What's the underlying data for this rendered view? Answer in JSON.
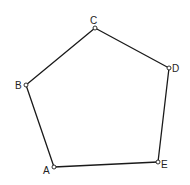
{
  "diagram": {
    "type": "pentagon",
    "vertices": [
      {
        "id": "A",
        "label": "A",
        "x": 54,
        "y": 167,
        "lx": 43,
        "ly": 174
      },
      {
        "id": "B",
        "label": "B",
        "x": 26,
        "y": 85,
        "lx": 15,
        "ly": 89
      },
      {
        "id": "C",
        "label": "C",
        "x": 95,
        "y": 28,
        "lx": 90,
        "ly": 24
      },
      {
        "id": "D",
        "label": "D",
        "x": 169,
        "y": 68,
        "lx": 172,
        "ly": 72
      },
      {
        "id": "E",
        "label": "E",
        "x": 158,
        "y": 162,
        "lx": 161,
        "ly": 168
      }
    ],
    "edges": [
      [
        "A",
        "B"
      ],
      [
        "B",
        "C"
      ],
      [
        "C",
        "D"
      ],
      [
        "D",
        "E"
      ],
      [
        "E",
        "A"
      ]
    ],
    "colors": {
      "stroke": "#1a1a1a",
      "background": "#ffffff"
    }
  }
}
